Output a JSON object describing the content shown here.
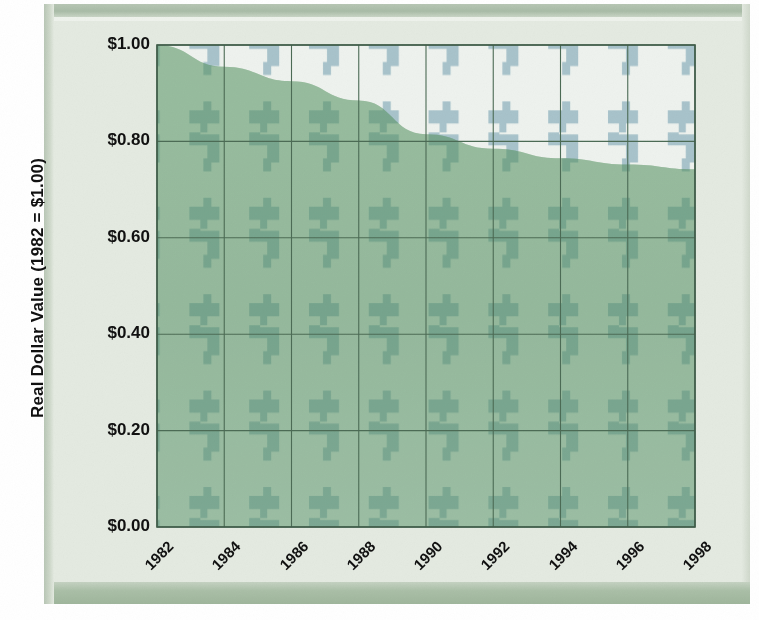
{
  "chart_data": {
    "type": "area",
    "title": "",
    "xlabel": "",
    "ylabel": "Real Dollar Value (1982  =  $1.00)",
    "x": [
      1982,
      1984,
      1986,
      1988,
      1990,
      1992,
      1994,
      1996,
      1998
    ],
    "categories": [
      "1982",
      "1984",
      "1986",
      "1988",
      "1990",
      "1992",
      "1994",
      "1996",
      "1998"
    ],
    "values": [
      1.0,
      0.955,
      0.925,
      0.885,
      0.815,
      0.785,
      0.765,
      0.752,
      0.742
    ],
    "series": [
      {
        "name": "Real Dollar Value",
        "values": [
          1.0,
          0.955,
          0.925,
          0.885,
          0.815,
          0.785,
          0.765,
          0.752,
          0.742
        ]
      }
    ],
    "ylim": [
      0.0,
      1.0
    ],
    "xlim": [
      1982,
      1998
    ],
    "ytick_values": [
      0.0,
      0.2,
      0.4,
      0.6,
      0.8,
      1.0
    ],
    "ytick_labels": [
      "$0.00",
      "$0.20",
      "$0.40",
      "$0.60",
      "$0.80",
      "$1.00"
    ],
    "grid": true,
    "legend": "none",
    "legend_position": "none",
    "annotations": [],
    "fill_color": "#4f8f5e",
    "background_pattern": "dollar-sign-watermark",
    "pattern_color": "#a8c3cb",
    "plot_background": "#eef2ee",
    "gridline_color": "#4c6b55",
    "frame_color": "#dde4dc"
  },
  "axis": {
    "y_title": "Real Dollar Value (1982  =  $1.00)",
    "y_ticks": [
      "$1.00",
      "$0.80",
      "$0.60",
      "$0.40",
      "$0.20",
      "$0.00"
    ],
    "x_ticks": [
      "1982",
      "1984",
      "1986",
      "1988",
      "1990",
      "1992",
      "1994",
      "1996",
      "1998"
    ]
  }
}
